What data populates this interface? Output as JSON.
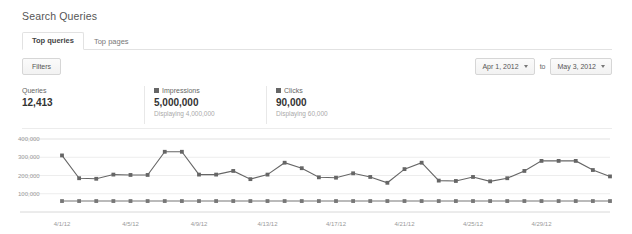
{
  "header": {
    "title": "Search Queries"
  },
  "tabs": [
    {
      "label": "Top queries",
      "active": true
    },
    {
      "label": "Top pages",
      "active": false
    }
  ],
  "toolbar": {
    "filters_label": "Filters",
    "date_start": "Apr 1, 2012",
    "date_to_label": "to",
    "date_end": "May 3, 2012"
  },
  "metrics": [
    {
      "label": "Queries",
      "value": "12,413",
      "sub": "",
      "color": ""
    },
    {
      "label": "Impressions",
      "value": "5,000,000",
      "sub": "Displaying 4,000,000",
      "color": "#666666"
    },
    {
      "label": "Clicks",
      "value": "90,000",
      "sub": "Displaying 60,000",
      "color": "#666666"
    }
  ],
  "chart_data": {
    "type": "line",
    "title": "",
    "xlabel": "",
    "ylabel": "",
    "ylim": [
      0,
      400000
    ],
    "grid": true,
    "legend_position": "above-chart",
    "ytick_labels": [
      "400,000",
      "300,000",
      "200,000",
      "100,000"
    ],
    "ytick_values": [
      400000,
      300000,
      200000,
      100000
    ],
    "xtick_labels": [
      "4/1/12",
      "4/5/12",
      "4/9/12",
      "4/13/12",
      "4/17/12",
      "4/21/12",
      "4/25/12",
      "4/29/12"
    ],
    "xtick_indices": [
      0,
      4,
      8,
      12,
      16,
      20,
      24,
      28
    ],
    "x": [
      "4/1/12",
      "4/2/12",
      "4/3/12",
      "4/4/12",
      "4/5/12",
      "4/6/12",
      "4/7/12",
      "4/8/12",
      "4/9/12",
      "4/10/12",
      "4/11/12",
      "4/12/12",
      "4/13/12",
      "4/14/12",
      "4/15/12",
      "4/16/12",
      "4/17/12",
      "4/18/12",
      "4/19/12",
      "4/20/12",
      "4/21/12",
      "4/22/12",
      "4/23/12",
      "4/24/12",
      "4/25/12",
      "4/26/12",
      "4/27/12",
      "4/28/12",
      "4/29/12",
      "4/30/12",
      "5/1/12",
      "5/2/12",
      "5/3/12"
    ],
    "series": [
      {
        "name": "Impressions",
        "color": "#666666",
        "values": [
          310000,
          185000,
          182000,
          205000,
          203000,
          203000,
          330000,
          330000,
          205000,
          205000,
          225000,
          180000,
          205000,
          270000,
          240000,
          190000,
          188000,
          212000,
          192000,
          160000,
          235000,
          270000,
          172000,
          170000,
          192000,
          168000,
          185000,
          225000,
          280000,
          280000,
          280000,
          230000,
          195000
        ]
      },
      {
        "name": "Clicks",
        "color": "#777777",
        "values": [
          60000,
          60000,
          60000,
          60000,
          60000,
          60000,
          60000,
          60000,
          60000,
          60000,
          60000,
          60000,
          60000,
          60000,
          60000,
          60000,
          60000,
          60000,
          60000,
          60000,
          60000,
          60000,
          60000,
          60000,
          60000,
          60000,
          60000,
          60000,
          60000,
          60000,
          60000,
          60000,
          60000
        ]
      }
    ]
  }
}
